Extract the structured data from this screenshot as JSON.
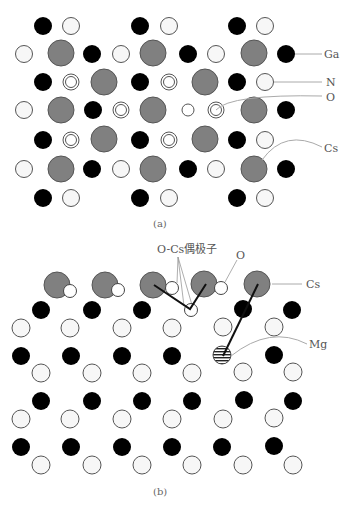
{
  "colors": {
    "ga": "#000000",
    "n": "#f7f7f7",
    "cs": "#808080",
    "stroke": "#555555",
    "leader": "#aaaaaa",
    "bond": "#111111"
  },
  "panel_a": {
    "caption": "(a)",
    "labels": {
      "ga": "Ga",
      "n": "N",
      "o": "O",
      "cs": "Cs"
    }
  },
  "panel_b": {
    "caption": "(b)",
    "labels": {
      "dipole": "O-Cs偶极子",
      "o": "O",
      "cs": "Cs",
      "mg": "Mg"
    }
  },
  "legend": [
    {
      "species": "Ga",
      "style": "black filled circle"
    },
    {
      "species": "N",
      "style": "white circle"
    },
    {
      "species": "O",
      "style": "double-ring circle"
    },
    {
      "species": "Cs",
      "style": "large gray circle"
    },
    {
      "species": "Mg",
      "style": "striped circle"
    }
  ]
}
